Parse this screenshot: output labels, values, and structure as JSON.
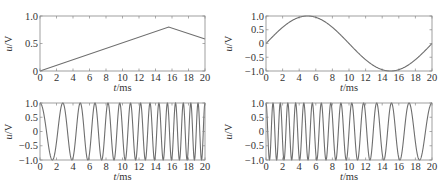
{
  "chart_data": [
    {
      "id": "triangle",
      "type": "line",
      "title": "",
      "xlabel_italic": "t",
      "xlabel_unit": "/ms",
      "ylabel_italic": "u",
      "ylabel_unit": "/V",
      "xlim": [
        0,
        20
      ],
      "ylim": [
        0,
        1.0
      ],
      "xticks": [
        0,
        2,
        4,
        6,
        8,
        10,
        12,
        14,
        16,
        18,
        20
      ],
      "yticks": [
        0,
        0.5,
        1.0
      ],
      "ytick_labels": [
        "0",
        "0.5",
        "1.0"
      ],
      "grid": false,
      "series": [
        {
          "name": "u(t)",
          "x": [
            0,
            15.6,
            20
          ],
          "y": [
            0,
            0.8,
            0.58
          ]
        }
      ]
    },
    {
      "id": "sine",
      "type": "line",
      "title": "",
      "xlabel_italic": "t",
      "xlabel_unit": "/ms",
      "ylabel_italic": "u",
      "ylabel_unit": "/V",
      "xlim": [
        0,
        20
      ],
      "ylim": [
        -1.0,
        1.0
      ],
      "xticks": [
        0,
        2,
        4,
        6,
        8,
        10,
        12,
        14,
        16,
        18,
        20
      ],
      "yticks": [
        -1.0,
        -0.5,
        0,
        0.5,
        1.0
      ],
      "ytick_labels": [
        "−1.0",
        "−0.5",
        "0",
        "0.5",
        "1.0"
      ],
      "grid": false,
      "series": [
        {
          "name": "u(t)=sin(2π·t/20)",
          "x": [
            0,
            2.5,
            5,
            7.5,
            10,
            12.5,
            15,
            17.5,
            20
          ],
          "y": [
            0,
            0.71,
            1.0,
            0.71,
            0,
            -0.71,
            -1.0,
            -0.71,
            0
          ],
          "formula": {
            "kind": "sin",
            "period": 20,
            "amp": 1
          }
        }
      ]
    },
    {
      "id": "chirp-up",
      "type": "line",
      "title": "",
      "xlabel_italic": "t",
      "xlabel_unit": "/ms",
      "ylabel_italic": "u",
      "ylabel_unit": "/V",
      "xlim": [
        0,
        20
      ],
      "ylim": [
        -1.0,
        1.0
      ],
      "xticks": [
        0,
        2,
        4,
        6,
        8,
        10,
        12,
        14,
        16,
        18,
        20
      ],
      "yticks": [
        -1.0,
        -0.5,
        0,
        0.5,
        1.0
      ],
      "ytick_labels": [
        "−1.0",
        "−0.5",
        "0",
        "0.5",
        "1.0"
      ],
      "grid": false,
      "series": [
        {
          "name": "up-chirp cosine",
          "description": "frequency increases from ~0.3 to ~1.2 cycles/ms",
          "formula": {
            "kind": "chirp",
            "f0": 0.3,
            "k": 0.045,
            "reverse": false
          }
        }
      ]
    },
    {
      "id": "chirp-down",
      "type": "line",
      "title": "",
      "xlabel_italic": "t",
      "xlabel_unit": "/ms",
      "ylabel_italic": "u",
      "ylabel_unit": "/V",
      "xlim": [
        0,
        20
      ],
      "ylim": [
        -1.0,
        1.0
      ],
      "xticks": [
        0,
        2,
        4,
        6,
        8,
        10,
        12,
        14,
        16,
        18,
        20
      ],
      "yticks": [
        -1.0,
        -0.5,
        0,
        0.5,
        1.0
      ],
      "ytick_labels": [
        "−1.0",
        "−0.5",
        "0",
        "0.5",
        "1.0"
      ],
      "grid": false,
      "series": [
        {
          "name": "down-chirp cosine",
          "description": "frequency decreases from ~1.2 to ~0.3 cycles/ms",
          "formula": {
            "kind": "chirp",
            "f0": 0.3,
            "k": 0.045,
            "reverse": true
          }
        }
      ]
    }
  ],
  "style": {
    "line_color": "#6e6e6e",
    "axis_color": "#888888",
    "text_color": "#333333"
  }
}
